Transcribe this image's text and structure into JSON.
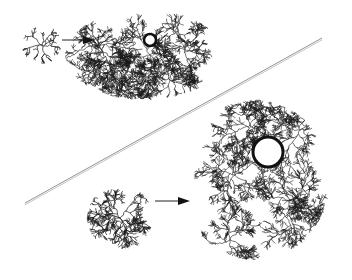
{
  "figure": {
    "background": "#ffffff",
    "ink": "#1a1a1a",
    "top_panel": {
      "seed_cluster": {
        "cx": 42,
        "cy": 45,
        "r": 18
      },
      "arrow": {
        "x1": 62,
        "y1": 40,
        "x2": 95,
        "y2": 40
      },
      "grown_cluster": {
        "cx": 145,
        "cy": 55,
        "rx": 80,
        "ry": 45
      },
      "target_circle": {
        "cx": 150,
        "cy": 40,
        "r": 6
      }
    },
    "divider": {
      "x1": 25,
      "y1": 203,
      "x2": 322,
      "y2": 38
    },
    "bottom_panel": {
      "seed_cluster": {
        "cx": 120,
        "cy": 218,
        "r": 30
      },
      "arrow": {
        "x1": 155,
        "y1": 201,
        "x2": 190,
        "y2": 201
      },
      "grown_cluster": {
        "cx": 255,
        "cy": 180,
        "rx": 75,
        "ry": 80
      },
      "target_circle": {
        "cx": 268,
        "cy": 152,
        "r": 15
      }
    }
  }
}
